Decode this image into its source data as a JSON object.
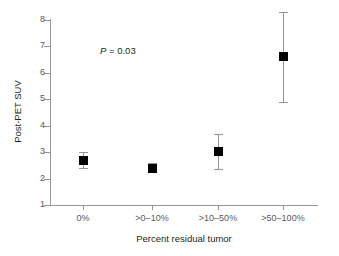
{
  "chart_data": {
    "type": "scatter",
    "title": "",
    "xlabel": "Percent residual tumor",
    "ylabel": "Post-PET SUV",
    "categories": [
      "0%",
      ">0–10%",
      ">10–50%",
      ">50–100%"
    ],
    "values": [
      2.7,
      2.4,
      3.05,
      6.65
    ],
    "error_low": [
      2.4,
      2.25,
      2.35,
      4.9
    ],
    "error_high": [
      3.0,
      2.6,
      3.7,
      8.3
    ],
    "ylim": [
      1,
      8
    ],
    "yticks": [
      1,
      2,
      3,
      4,
      5,
      6,
      7,
      8
    ],
    "ytick_labels": [
      "1",
      "2",
      "3",
      "4",
      "5",
      "6",
      "7",
      "8"
    ],
    "grid": false,
    "legend": "none",
    "annotations": [
      {
        "text_italic": "P",
        "text_rest": " = 0.03",
        "x_category_between": 1,
        "y": 7.0
      }
    ],
    "marker_style": "filled-square",
    "marker_color": "#000000",
    "error_bar_color": "#939598",
    "axis_color": "#939598",
    "background_color": "#ffffff"
  },
  "figure": {
    "x_axis_title": "Percent residual tumor",
    "y_axis_title": "Post-PET SUV",
    "pvalue_italic": "P",
    "pvalue_rest": " = 0.03"
  }
}
